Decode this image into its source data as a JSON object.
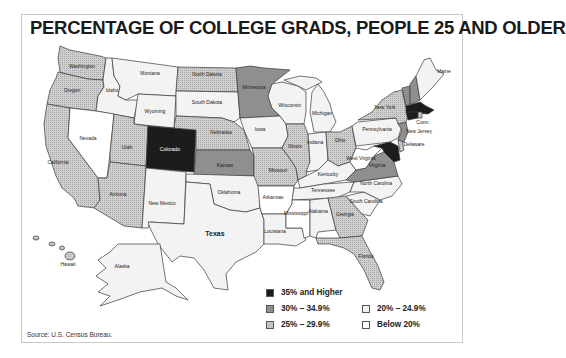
{
  "title": "PERCENTAGE OF COLLEGE GRADS, PEOPLE 25 AND OLDER",
  "source": "Source: U.S. Census Bureau.",
  "colors": {
    "c35plus": "#1c1c1c",
    "c30": "#8f8f8f",
    "c25": "#c4c4c4",
    "c20": "#f1f1f1",
    "cbelow20": "#ffffff"
  },
  "legend": [
    {
      "key": "c35plus",
      "label": "35% and Higher"
    },
    {
      "key": "c30",
      "label": "30% – 34.9%"
    },
    {
      "key": "c25",
      "label": "25% – 29.9%"
    },
    {
      "key": "c20",
      "label": "20% – 24.9%"
    },
    {
      "key": "cbelow20",
      "label": "Below 20%"
    }
  ],
  "states": {
    "washington": {
      "label": "Washington",
      "class": "25% – 29.9%"
    },
    "oregon": {
      "label": "Oregon",
      "class": "25% – 29.9%"
    },
    "california": {
      "label": "California",
      "class": "25% – 29.9%"
    },
    "idaho": {
      "label": "Idaho",
      "class": "20% – 24.9%"
    },
    "nevada": {
      "label": "Nevada",
      "class": "Below 20%"
    },
    "montana": {
      "label": "Montana",
      "class": "20% – 24.9%"
    },
    "wyoming": {
      "label": "Wyoming",
      "class": "20% – 24.9%"
    },
    "utah": {
      "label": "Utah",
      "class": "25% – 29.9%"
    },
    "arizona": {
      "label": "Arizona",
      "class": "25% – 29.9%"
    },
    "colorado": {
      "label": "Colorado",
      "class": "35% and Higher"
    },
    "new_mexico": {
      "label": "New Mexico",
      "class": "20% – 24.9%"
    },
    "north_dakota": {
      "label": "North Dakota",
      "class": "25% – 29.9%"
    },
    "south_dakota": {
      "label": "South Dakota",
      "class": "20% – 24.9%"
    },
    "nebraska": {
      "label": "Nebraska",
      "class": "25% – 29.9%"
    },
    "kansas": {
      "label": "Kansas",
      "class": "30% – 34.9%"
    },
    "oklahoma": {
      "label": "Oklahoma",
      "class": "20% – 24.9%"
    },
    "texas": {
      "label": "Texas",
      "class": "20% – 24.9%"
    },
    "minnesota": {
      "label": "Minnesota",
      "class": "30% – 34.9%"
    },
    "iowa": {
      "label": "Iowa",
      "class": "20% – 24.9%"
    },
    "missouri": {
      "label": "Missouri",
      "class": "25% – 29.9%"
    },
    "arkansas": {
      "label": "Arkansas",
      "class": "Below 20%"
    },
    "louisiana": {
      "label": "Louisiana",
      "class": "20% – 24.9%"
    },
    "wisconsin": {
      "label": "Wisconsin",
      "class": "20% – 24.9%"
    },
    "illinois": {
      "label": "Illinois",
      "class": "25% – 29.9%"
    },
    "michigan": {
      "label": "Michigan",
      "class": "20% – 24.9%"
    },
    "indiana": {
      "label": "Indiana",
      "class": "20% – 24.9%"
    },
    "ohio": {
      "label": "Ohio",
      "class": "25% – 29.9%"
    },
    "kentucky": {
      "label": "Kentucky",
      "class": "20% – 24.9%"
    },
    "tennessee": {
      "label": "Tennessee",
      "class": "20% – 24.9%"
    },
    "mississippi": {
      "label": "Mississippi",
      "class": "Below 20%"
    },
    "alabama": {
      "label": "Alabama",
      "class": "20% – 24.9%"
    },
    "georgia": {
      "label": "Georgia",
      "class": "25% – 29.9%"
    },
    "florida": {
      "label": "Florida",
      "class": "25% – 29.9%"
    },
    "south_carolina": {
      "label": "South Carolina",
      "class": "20% – 24.9%"
    },
    "north_carolina": {
      "label": "North Carolina",
      "class": "20% – 24.9%"
    },
    "virginia": {
      "label": "Virginia",
      "class": "30% – 34.9%"
    },
    "west_virginia": {
      "label": "West Virginia",
      "class": "Below 20%"
    },
    "pennsylvania": {
      "label": "Pennsylvania",
      "class": "20% – 24.9%"
    },
    "new_york": {
      "label": "New York",
      "class": "25% – 29.9%"
    },
    "new_jersey": {
      "label": "New Jersey",
      "class": "30% – 34.9%"
    },
    "delaware": {
      "label": "Delaware",
      "class": "25% – 29.9%"
    },
    "maryland": {
      "label": "Md.",
      "class": "35% and Higher"
    },
    "vermont": {
      "label": "Vt.",
      "class": "30% – 34.9%"
    },
    "new_hampshire": {
      "label": "N.H.",
      "class": "30% – 34.9%"
    },
    "maine": {
      "label": "Maine",
      "class": "20% – 24.9%"
    },
    "massachusetts": {
      "label": "Mass.",
      "class": "35% and Higher"
    },
    "rhode_island": {
      "label": "R.I.",
      "class": "25% – 29.9%"
    },
    "connecticut": {
      "label": "Conn.",
      "class": "35% and Higher"
    },
    "dc": {
      "label": "D.C.",
      "class": "35% and Higher"
    },
    "alaska": {
      "label": "Alaska",
      "class": "20% – 24.9%"
    },
    "hawaii": {
      "label": "Hawaii",
      "class": "25% – 29.9%"
    }
  }
}
